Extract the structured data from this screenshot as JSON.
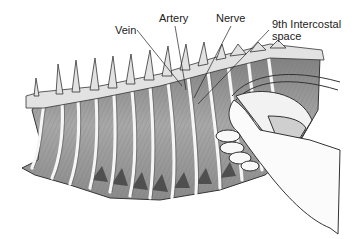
{
  "figure": {
    "labels": [
      {
        "id": "vein",
        "text": "Vein"
      },
      {
        "id": "artery",
        "text": "Artery"
      },
      {
        "id": "nerve",
        "text": "Nerve"
      },
      {
        "id": "intercostal",
        "line1": "9th Intercostal",
        "line2": "space"
      }
    ],
    "colors": {
      "background": "#ffffff",
      "ink": "#222222",
      "muscle_shade": "#9a9a9a",
      "rib": "#f4f4f4",
      "shadow": "#3a3a3a"
    }
  }
}
